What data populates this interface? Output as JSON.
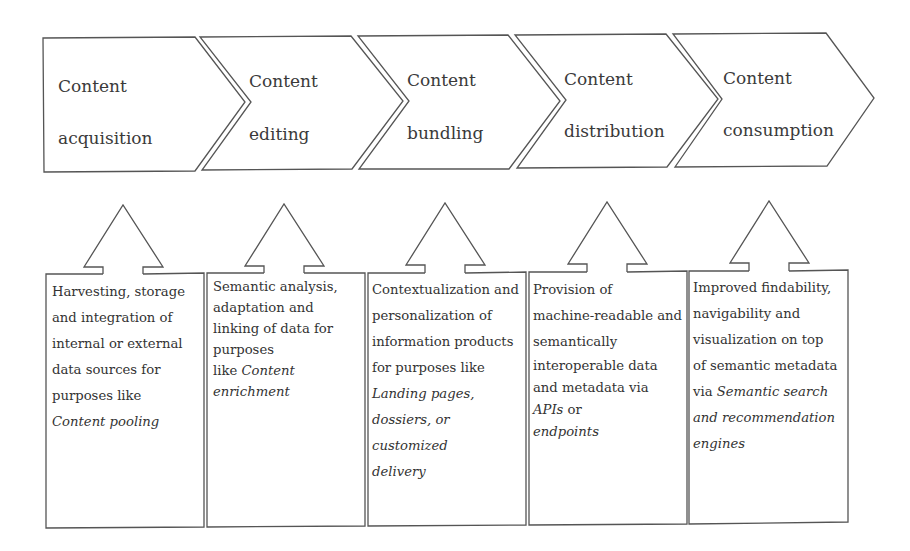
{
  "diagram": {
    "stages": [
      {
        "line1": "Content",
        "line2": "acquisition"
      },
      {
        "line1": "Content",
        "line2": "editing"
      },
      {
        "line1": "Content",
        "line2": "bundling"
      },
      {
        "line1": "Content",
        "line2": "distribution"
      },
      {
        "line1": "Content",
        "line2": "consumption"
      }
    ],
    "descriptions": [
      {
        "lines": [
          "Harvesting,  storage",
          "and integration of",
          "internal or external",
          "data sources for",
          "purposes like"
        ],
        "italic": [
          "Content pooling"
        ]
      },
      {
        "lines": [
          "Semantic  analysis,",
          "adaptation and",
          "linking of data for",
          "purposes"
        ],
        "like_prefix": "like ",
        "italic": [
          "Content",
          "enrichment"
        ]
      },
      {
        "lines": [
          "Contextualization and",
          "personalization of",
          "information products",
          "for purposes like"
        ],
        "italic": [
          "Landing pages,",
          "dossiers, or",
          "customized",
          "delivery"
        ]
      },
      {
        "lines": [
          "Provision of",
          "machine-readable and",
          "semantically",
          "interoperable data",
          "and metadata via"
        ],
        "apis_italic": "APIs",
        "apis_suffix": " or",
        "italic": [
          "endpoints"
        ]
      },
      {
        "lines": [
          "Improved findability,",
          "navigability and",
          "visualization on top",
          "of semantic metadata"
        ],
        "via_prefix": "via ",
        "italic": [
          "Semantic search",
          "and recommendation",
          "engines"
        ]
      }
    ],
    "colors": {
      "stroke": "#555555",
      "text": "#333333",
      "background": "#ffffff"
    }
  }
}
